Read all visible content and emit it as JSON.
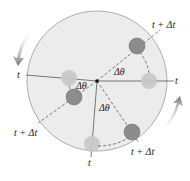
{
  "diagram": {
    "labels": {
      "t": "t",
      "t_plus_dt": "t + Δt",
      "dtheta": "Δθ"
    },
    "colors": {
      "disk": "#ebebeb",
      "disk_edge": "#999999",
      "ball_start": "#c9c9c9",
      "ball_end": "#8c8c8c",
      "arrow": "#8a8a8a"
    }
  }
}
